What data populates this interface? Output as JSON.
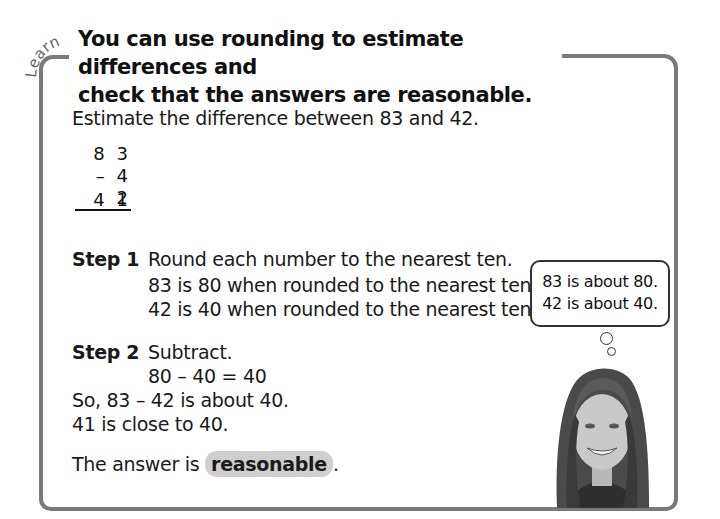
{
  "section_label": "Learn",
  "title": "You can use rounding to estimate differences and check that the answers are reasonable.",
  "title_lines": [
    "You can use rounding to estimate differences and",
    "check that the answers are reasonable."
  ],
  "prompt": "Estimate the difference between 83 and 42.",
  "vertical_subtraction": {
    "minuend": "8 3",
    "subtrahend": "– 4 2",
    "result": "4 1"
  },
  "step1": {
    "label": "Step 1",
    "instruction": "Round each number to the nearest ten.",
    "lines": [
      "83 is 80 when rounded to the nearest ten.",
      "42 is 40 when rounded to the nearest ten."
    ]
  },
  "step2": {
    "label": "Step 2",
    "instruction": "Subtract.",
    "equation": "80 – 40 = 40"
  },
  "conclusion": {
    "line1": "So, 83 – 42 is about 40.",
    "line2": "41 is close to 40.",
    "answer_prefix": "The answer is",
    "answer_highlight": "reasonable",
    "answer_suffix": "."
  },
  "thought_bubble": {
    "lines": [
      "83 is about 80.",
      "42 is about 40."
    ]
  },
  "image": {
    "description": "smiling girl photo"
  },
  "colors": {
    "frame": "#7a7a7a",
    "highlight": "#cfcfcf",
    "text": "#111111"
  }
}
